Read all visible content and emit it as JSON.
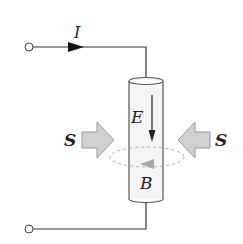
{
  "diagram": {
    "type": "physics-schematic",
    "labels": {
      "current": "I",
      "electric_field": "E",
      "magnetic_field": "B",
      "poynting_left": "S",
      "poynting_right": "S"
    },
    "colors": {
      "line": "#333333",
      "arrow_fill": "#d0d0d0",
      "arrow_stroke": "#9a9a9a",
      "cylinder_fill": "#f4f4f4",
      "dashed_loop": "#b0b0b0",
      "b_arrow": "#a8a8a8"
    }
  }
}
